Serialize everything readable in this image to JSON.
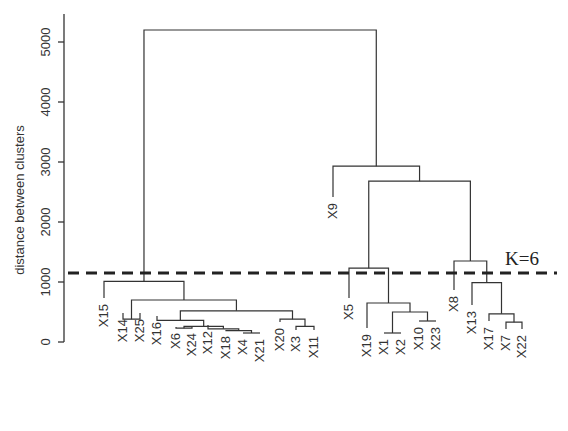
{
  "chart_data": {
    "type": "dendrogram",
    "title": "",
    "xlabel": "",
    "ylabel": "distance between clusters",
    "ylim": [
      0,
      5300
    ],
    "yticks": [
      0,
      1000,
      2000,
      3000,
      4000,
      5000
    ],
    "grid": false,
    "leaves": [
      "X15",
      "X14",
      "X25",
      "X16",
      "X6",
      "X24",
      "X12",
      "X18",
      "X4",
      "X21",
      "X20",
      "X3",
      "X11",
      "X9",
      "X5",
      "X19",
      "X1",
      "X2",
      "X10",
      "X23",
      "X8",
      "X13",
      "X17",
      "X7",
      "X22"
    ],
    "cut_line": {
      "height": 1150,
      "label": "K=6",
      "style": "dashed"
    },
    "clusters_k6": [
      [
        "X15"
      ],
      [
        "X14",
        "X25",
        "X16",
        "X6",
        "X24",
        "X12",
        "X18",
        "X4",
        "X21",
        "X20",
        "X3",
        "X11"
      ],
      [
        "X9"
      ],
      [
        "X5",
        "X19",
        "X1",
        "X2",
        "X10",
        "X23"
      ],
      [
        "X8"
      ],
      [
        "X13",
        "X17",
        "X7",
        "X22"
      ]
    ],
    "merges": [
      {
        "a": "X18",
        "b": "X4+X21",
        "height": 190
      },
      {
        "a": "X4",
        "b": "X21",
        "height": 150
      },
      {
        "a": "X12",
        "b": "X18+X4+X21",
        "height": 220
      },
      {
        "a": "X6",
        "b": "X24",
        "height": 230
      },
      {
        "a": "X6+X24",
        "b": "X12+X18+X4+X21",
        "height": 260
      },
      {
        "a": "X16",
        "b": "X6..X21",
        "height": 360
      },
      {
        "a": "X3",
        "b": "X11",
        "height": 260
      },
      {
        "a": "X20",
        "b": "X3+X11",
        "height": 380
      },
      {
        "a": "X16..X21",
        "b": "X20+X3+X11",
        "height": 520
      },
      {
        "a": "X14",
        "b": "X25",
        "height": 380
      },
      {
        "a": "X14+X25",
        "b": "X16..X11",
        "height": 700
      },
      {
        "a": "X15",
        "b": "X14..X11",
        "height": 1000
      },
      {
        "a": "X1",
        "b": "X2",
        "height": 150
      },
      {
        "a": "X10",
        "b": "X23",
        "height": 350
      },
      {
        "a": "X1+X2",
        "b": "X10+X23",
        "height": 500
      },
      {
        "a": "X19",
        "b": "X1+X2+X10+X23",
        "height": 650
      },
      {
        "a": "X5",
        "b": "X19..X23",
        "height": 1200
      },
      {
        "a": "X7",
        "b": "X22",
        "height": 330
      },
      {
        "a": "X17",
        "b": "X7+X22",
        "height": 470
      },
      {
        "a": "X13",
        "b": "X17+X7+X22",
        "height": 990
      },
      {
        "a": "X8",
        "b": "X13..X22",
        "height": 1350
      },
      {
        "a": "X5..X23",
        "b": "X8..X22",
        "height": 2650
      },
      {
        "a": "X9",
        "b": "X5..X22",
        "height": 2900
      },
      {
        "a": "X15..X11",
        "b": "X9..X22",
        "height": 5200
      }
    ]
  },
  "labels": {
    "ylabel": "distance between clusters",
    "cut": "K=6",
    "ticks": [
      "0",
      "1000",
      "2000",
      "3000",
      "4000",
      "5000"
    ]
  }
}
